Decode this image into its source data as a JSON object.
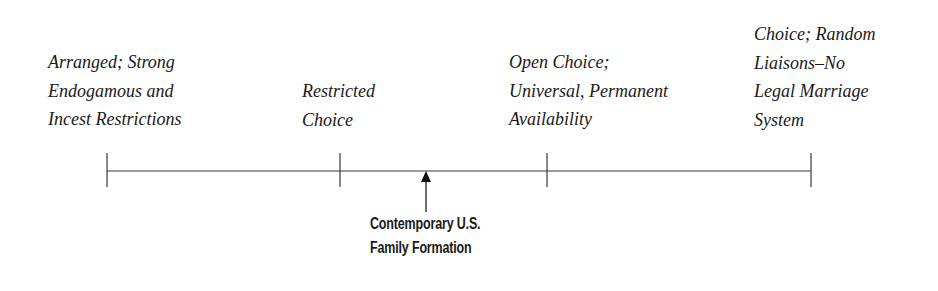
{
  "diagram": {
    "type": "continuum",
    "ticks": [
      {
        "position_px": 107,
        "label_lines": [
          "Arranged; Strong",
          "Endogamous and",
          "Incest Restrictions"
        ]
      },
      {
        "position_px": 340,
        "label_lines": [
          "Restricted",
          "Choice"
        ]
      },
      {
        "position_px": 547,
        "label_lines": [
          "Open Choice;",
          "Universal, Permanent",
          "Availability"
        ]
      },
      {
        "position_px": 811,
        "label_lines": [
          "Choice; Random",
          "Liaisons–No",
          "Legal Marriage",
          "System"
        ]
      }
    ],
    "marker": {
      "position_px": 426,
      "label_lines": [
        "Contemporary U.S.",
        "Family Formation"
      ]
    },
    "colors": {
      "line": "#3a3a3a",
      "text": "#1a1a1a",
      "background": "#ffffff"
    }
  }
}
